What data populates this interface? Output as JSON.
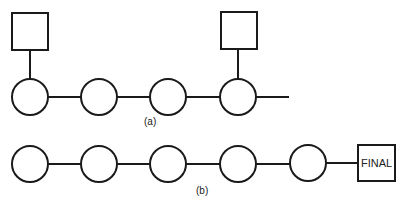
{
  "diagram": {
    "colors": {
      "stroke": "#1a1a1a",
      "background": "#ffffff"
    },
    "part_a": {
      "label": "(a)",
      "nodes": [
        {
          "id": "a1",
          "shape": "circle",
          "has_square_above": true
        },
        {
          "id": "a2",
          "shape": "circle",
          "has_square_above": false
        },
        {
          "id": "a3",
          "shape": "circle",
          "has_square_above": false
        },
        {
          "id": "a4",
          "shape": "circle",
          "has_square_above": true
        }
      ],
      "squares": [
        {
          "id": "sq1",
          "attached_to": "a1",
          "text": ""
        },
        {
          "id": "sq2",
          "attached_to": "a4",
          "text": ""
        }
      ],
      "trailing_line": true
    },
    "part_b": {
      "label": "(b)",
      "nodes": [
        {
          "id": "b1",
          "shape": "circle"
        },
        {
          "id": "b2",
          "shape": "circle"
        },
        {
          "id": "b3",
          "shape": "circle"
        },
        {
          "id": "b4",
          "shape": "circle"
        },
        {
          "id": "b5",
          "shape": "circle"
        }
      ],
      "final_box": {
        "text": "FINAL"
      }
    }
  }
}
